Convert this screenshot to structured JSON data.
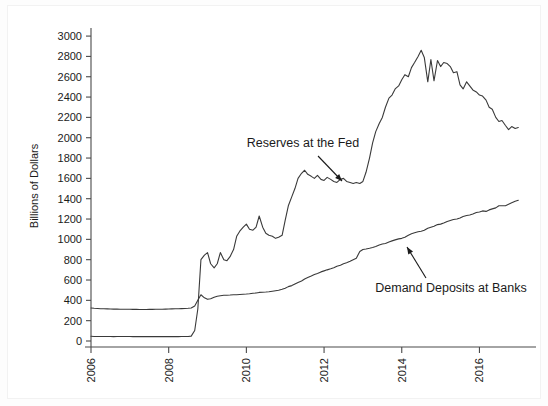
{
  "chart_data": {
    "type": "line",
    "title": "",
    "xlabel": "",
    "ylabel": "Billions of Dollars",
    "ylim": [
      0,
      3050
    ],
    "xlim": [
      2006.0,
      2017.25
    ],
    "ytick_values": [
      0,
      200,
      400,
      600,
      800,
      1000,
      1200,
      1400,
      1600,
      1800,
      2000,
      2200,
      2400,
      2600,
      2800,
      3000
    ],
    "ytick_labels": [
      "0",
      "200",
      "400",
      "600",
      "800",
      "1000",
      "1200",
      "1400",
      "1600",
      "1800",
      "2000",
      "2200",
      "2400",
      "2600",
      "2800",
      "3000"
    ],
    "xtick_values": [
      2006,
      2008,
      2010,
      2012,
      2014,
      2016
    ],
    "xtick_labels": [
      "2006",
      "2008",
      "2010",
      "2012",
      "2014",
      "2016"
    ],
    "grid": false,
    "legend_position": "inline-annotations",
    "line_color": "#3a3a3a",
    "series": [
      {
        "name": "Reserves at the Fed",
        "annotation": "Reserves at the Fed",
        "x": [
          2006.0,
          2006.08,
          2006.17,
          2006.25,
          2006.33,
          2006.42,
          2006.5,
          2006.58,
          2006.67,
          2006.75,
          2006.83,
          2006.92,
          2007.0,
          2007.08,
          2007.17,
          2007.25,
          2007.33,
          2007.42,
          2007.5,
          2007.58,
          2007.67,
          2007.75,
          2007.83,
          2007.92,
          2008.0,
          2008.08,
          2008.17,
          2008.25,
          2008.33,
          2008.42,
          2008.5,
          2008.58,
          2008.67,
          2008.75,
          2008.83,
          2008.92,
          2009.0,
          2009.08,
          2009.17,
          2009.25,
          2009.33,
          2009.42,
          2009.5,
          2009.58,
          2009.67,
          2009.75,
          2009.83,
          2009.92,
          2010.0,
          2010.08,
          2010.17,
          2010.25,
          2010.33,
          2010.42,
          2010.5,
          2010.58,
          2010.67,
          2010.75,
          2010.83,
          2010.92,
          2011.0,
          2011.08,
          2011.17,
          2011.25,
          2011.33,
          2011.42,
          2011.5,
          2011.58,
          2011.67,
          2011.75,
          2011.83,
          2011.92,
          2012.0,
          2012.08,
          2012.17,
          2012.25,
          2012.33,
          2012.42,
          2012.5,
          2012.58,
          2012.67,
          2012.75,
          2012.83,
          2012.92,
          2013.0,
          2013.08,
          2013.17,
          2013.25,
          2013.33,
          2013.42,
          2013.5,
          2013.58,
          2013.67,
          2013.75,
          2013.83,
          2013.92,
          2014.0,
          2014.08,
          2014.17,
          2014.25,
          2014.33,
          2014.42,
          2014.5,
          2014.58,
          2014.67,
          2014.75,
          2014.83,
          2014.92,
          2015.0,
          2015.08,
          2015.17,
          2015.25,
          2015.33,
          2015.42,
          2015.5,
          2015.58,
          2015.67,
          2015.75,
          2015.83,
          2015.92,
          2016.0,
          2016.08,
          2016.17,
          2016.25,
          2016.33,
          2016.42,
          2016.5,
          2016.58,
          2016.67,
          2016.75,
          2016.83,
          2016.92,
          2017.0
        ],
        "y": [
          46,
          45,
          44,
          45,
          44,
          45,
          44,
          43,
          44,
          45,
          44,
          45,
          44,
          43,
          44,
          43,
          44,
          43,
          44,
          43,
          44,
          43,
          44,
          43,
          44,
          43,
          44,
          43,
          44,
          44,
          45,
          48,
          103,
          315,
          800,
          845,
          870,
          760,
          720,
          760,
          870,
          800,
          790,
          830,
          900,
          1030,
          1080,
          1120,
          1150,
          1100,
          1090,
          1120,
          1230,
          1120,
          1060,
          1040,
          1030,
          1010,
          1020,
          1040,
          1190,
          1330,
          1420,
          1500,
          1600,
          1650,
          1680,
          1640,
          1620,
          1600,
          1630,
          1590,
          1580,
          1610,
          1590,
          1570,
          1560,
          1590,
          1600,
          1570,
          1560,
          1550,
          1560,
          1550,
          1570,
          1660,
          1800,
          1950,
          2060,
          2140,
          2200,
          2300,
          2390,
          2420,
          2480,
          2510,
          2570,
          2620,
          2600,
          2690,
          2740,
          2800,
          2860,
          2790,
          2550,
          2770,
          2560,
          2760,
          2700,
          2740,
          2730,
          2700,
          2640,
          2650,
          2520,
          2480,
          2550,
          2510,
          2470,
          2450,
          2420,
          2410,
          2370,
          2300,
          2280,
          2200,
          2160,
          2170,
          2120,
          2080,
          2110,
          2090,
          2100
        ]
      },
      {
        "name": "Demand Deposits at Banks",
        "annotation": "Demand Deposits at Banks",
        "x": [
          2006.0,
          2006.08,
          2006.17,
          2006.25,
          2006.33,
          2006.42,
          2006.5,
          2006.58,
          2006.67,
          2006.75,
          2006.83,
          2006.92,
          2007.0,
          2007.08,
          2007.17,
          2007.25,
          2007.33,
          2007.42,
          2007.5,
          2007.58,
          2007.67,
          2007.75,
          2007.83,
          2007.92,
          2008.0,
          2008.08,
          2008.17,
          2008.25,
          2008.33,
          2008.42,
          2008.5,
          2008.58,
          2008.67,
          2008.75,
          2008.83,
          2008.92,
          2009.0,
          2009.08,
          2009.17,
          2009.25,
          2009.33,
          2009.42,
          2009.5,
          2009.58,
          2009.67,
          2009.75,
          2009.83,
          2009.92,
          2010.0,
          2010.08,
          2010.17,
          2010.25,
          2010.33,
          2010.42,
          2010.5,
          2010.58,
          2010.67,
          2010.75,
          2010.83,
          2010.92,
          2011.0,
          2011.08,
          2011.17,
          2011.25,
          2011.33,
          2011.42,
          2011.5,
          2011.58,
          2011.67,
          2011.75,
          2011.83,
          2011.92,
          2012.0,
          2012.08,
          2012.17,
          2012.25,
          2012.33,
          2012.42,
          2012.5,
          2012.58,
          2012.67,
          2012.75,
          2012.83,
          2012.92,
          2013.0,
          2013.08,
          2013.17,
          2013.25,
          2013.33,
          2013.42,
          2013.5,
          2013.58,
          2013.67,
          2013.75,
          2013.83,
          2013.92,
          2014.0,
          2014.08,
          2014.17,
          2014.25,
          2014.33,
          2014.42,
          2014.5,
          2014.58,
          2014.67,
          2014.75,
          2014.83,
          2014.92,
          2015.0,
          2015.08,
          2015.17,
          2015.25,
          2015.33,
          2015.42,
          2015.5,
          2015.58,
          2015.67,
          2015.75,
          2015.83,
          2015.92,
          2016.0,
          2016.08,
          2016.17,
          2016.25,
          2016.33,
          2016.42,
          2016.5,
          2016.58,
          2016.67,
          2016.75,
          2016.83,
          2016.92,
          2017.0
        ],
        "y": [
          325,
          322,
          320,
          318,
          317,
          316,
          315,
          314,
          314,
          313,
          313,
          312,
          312,
          311,
          311,
          310,
          310,
          310,
          311,
          311,
          312,
          312,
          313,
          314,
          315,
          316,
          317,
          318,
          319,
          320,
          322,
          325,
          345,
          400,
          455,
          425,
          410,
          415,
          430,
          440,
          445,
          450,
          450,
          452,
          455,
          455,
          458,
          460,
          462,
          465,
          470,
          472,
          478,
          480,
          482,
          485,
          490,
          495,
          500,
          510,
          520,
          535,
          545,
          560,
          575,
          590,
          610,
          625,
          640,
          655,
          665,
          680,
          690,
          700,
          710,
          720,
          735,
          745,
          760,
          770,
          785,
          800,
          815,
          880,
          900,
          905,
          912,
          920,
          930,
          945,
          955,
          960,
          975,
          985,
          995,
          1005,
          1010,
          1020,
          1040,
          1055,
          1065,
          1075,
          1080,
          1090,
          1110,
          1120,
          1130,
          1145,
          1150,
          1160,
          1175,
          1185,
          1195,
          1200,
          1210,
          1225,
          1235,
          1240,
          1250,
          1265,
          1270,
          1280,
          1275,
          1290,
          1300,
          1310,
          1330,
          1330,
          1330,
          1345,
          1360,
          1375,
          1385
        ]
      }
    ],
    "annotations": [
      {
        "id": "reserves-annotation",
        "text": "Reserves at the Fed",
        "text_x": 295,
        "text_y": 141,
        "anchor": "middle",
        "arrow_from_x": 310,
        "arrow_from_y": 150,
        "arrow_to_x": 334,
        "arrow_to_y": 175
      },
      {
        "id": "deposits-annotation",
        "text": "Demand Deposits at Banks",
        "text_x": 443,
        "text_y": 286,
        "anchor": "middle",
        "arrow_from_x": 418,
        "arrow_from_y": 272,
        "arrow_to_x": 399,
        "arrow_to_y": 241
      }
    ]
  },
  "axes": {
    "y_label": "Billions of Dollars"
  }
}
